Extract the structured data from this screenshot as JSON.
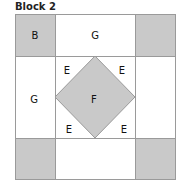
{
  "title": "Block 2",
  "colors": {
    "shaded": "#c9c9c9",
    "white": "#ffffff",
    "line": "#9a9a9a"
  },
  "labels": {
    "top_left": "B",
    "top_middle": "G",
    "middle_left": "G",
    "center": "F",
    "corner_top_left": "E",
    "corner_top_right": "E",
    "corner_bottom_left": "E",
    "corner_bottom_right": "E"
  }
}
